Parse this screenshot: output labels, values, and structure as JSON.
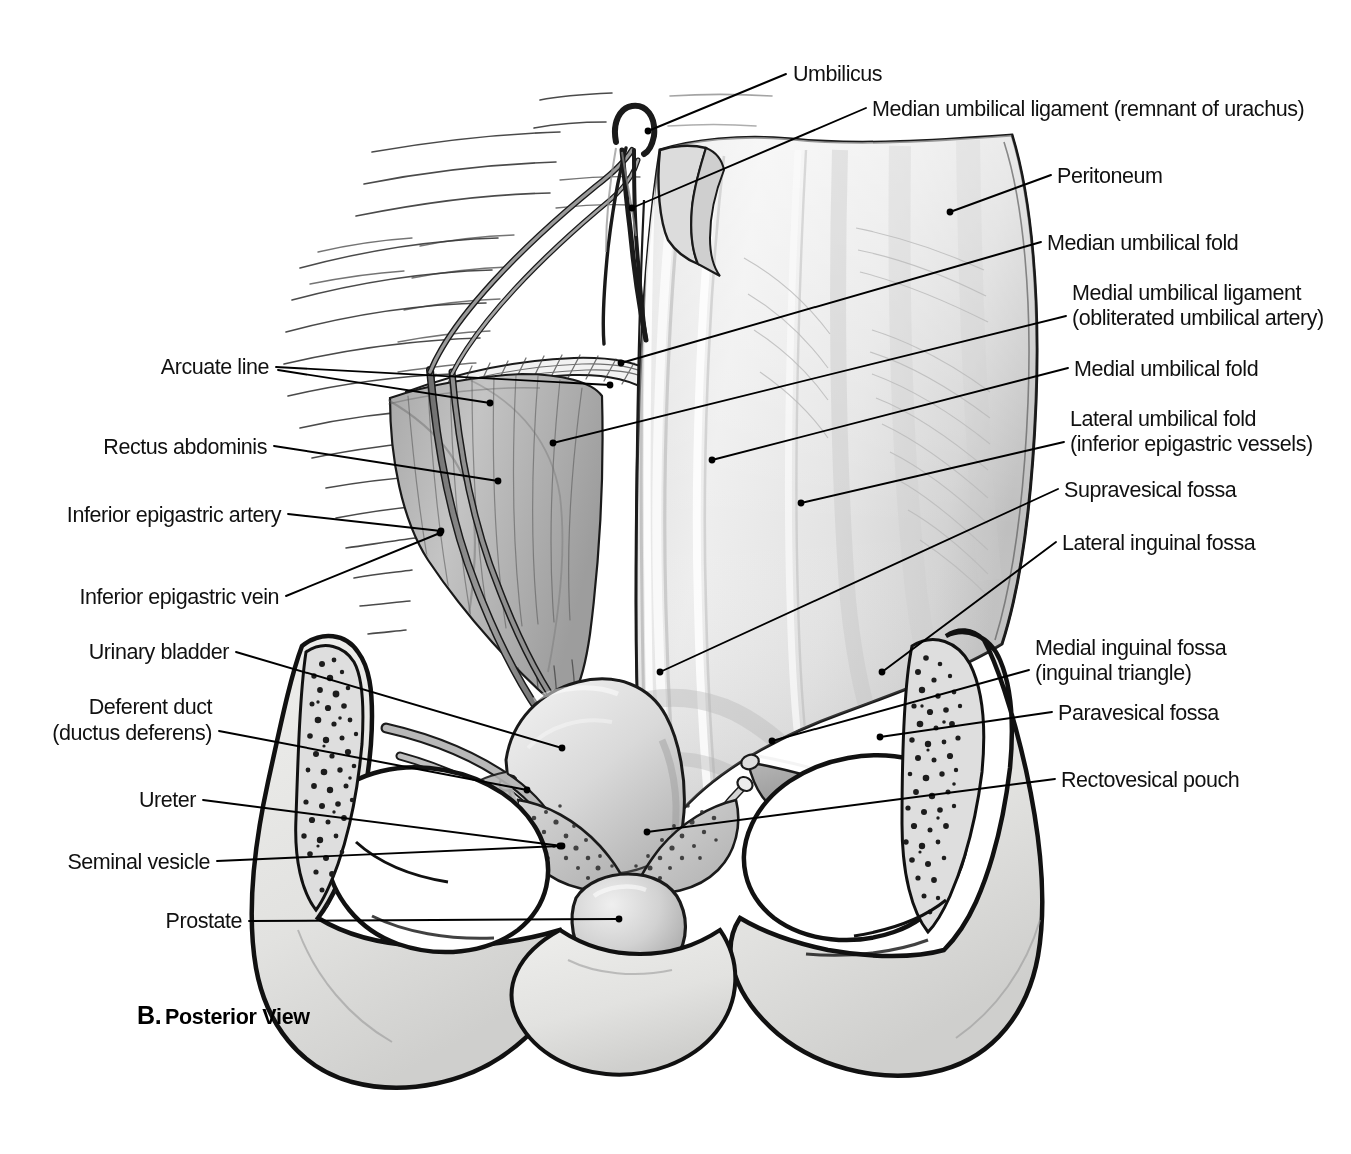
{
  "figure": {
    "caption_letter": "B.",
    "caption_text": "Posterior View"
  },
  "colors": {
    "ink": "#111111",
    "peritoneum_light": "#e9e9e9",
    "peritoneum_mid": "#d5d5d5",
    "peritoneum_shadow": "#b4b4b4",
    "bone_fill": "#e4e4e2",
    "bone_cut": "#d8d8d6",
    "muscle": "#bdbdbd",
    "vessel": "#8e8e8e",
    "bladder": "#d2d2d2",
    "prostate": "#c9c9c9",
    "background": "#ffffff"
  },
  "labels_right": [
    {
      "id": "umbilicus",
      "text": "Umbilicus",
      "x": 793,
      "y": 81,
      "leader": "M 786 74 L 648 131",
      "dot": [
        648,
        131
      ]
    },
    {
      "id": "median-umbilical-ligament",
      "text": "Median umbilical ligament (remnant of urachus)",
      "x": 872,
      "y": 116,
      "leader": "M 866 108 L 632 208",
      "dot": [
        632,
        208
      ]
    },
    {
      "id": "peritoneum",
      "text": "Peritoneum",
      "x": 1057,
      "y": 183,
      "leader": "M 1051 175 L 950 212",
      "dot": [
        950,
        212
      ]
    },
    {
      "id": "median-umbilical-fold",
      "text": "Median umbilical fold",
      "x": 1047,
      "y": 250,
      "leader": "M 1041 242 L 621 363",
      "dot": [
        621,
        363
      ]
    },
    {
      "id": "medial-umbilical-ligament",
      "text": "Medial umbilical ligament",
      "x": 1072,
      "y": 300,
      "leader": "M 1066 316 L 553 443",
      "dot": [
        553,
        443
      ]
    },
    {
      "id": "medial-umbilical-ligament-sub",
      "text": "(obliterated umbilical artery)",
      "x": 1072,
      "y": 325,
      "leader": "",
      "dot": null
    },
    {
      "id": "medial-umbilical-fold",
      "text": "Medial umbilical fold",
      "x": 1074,
      "y": 376,
      "leader": "M 1068 368 L 712 460",
      "dot": [
        712,
        460
      ]
    },
    {
      "id": "lateral-umbilical-fold",
      "text": "Lateral umbilical fold",
      "x": 1070,
      "y": 426,
      "leader": "M 1064 442 L 801 503",
      "dot": [
        801,
        503
      ]
    },
    {
      "id": "lateral-umbilical-fold-sub",
      "text": "(inferior epigastric vessels)",
      "x": 1070,
      "y": 451,
      "leader": "",
      "dot": null
    },
    {
      "id": "supravesical-fossa",
      "text": "Supravesical fossa",
      "x": 1064,
      "y": 497,
      "leader": "M 1058 489 L 660, 672",
      "dot": [
        660,
        672
      ]
    },
    {
      "id": "lateral-inguinal-fossa",
      "text": "Lateral inguinal fossa",
      "x": 1062,
      "y": 550,
      "leader": "M 1056 542 L 882 672",
      "dot": [
        882,
        672
      ]
    },
    {
      "id": "medial-inguinal-fossa",
      "text": "Medial inguinal fossa",
      "x": 1035,
      "y": 655,
      "leader": "M 1029 670 L 772 741",
      "dot": [
        772,
        741
      ]
    },
    {
      "id": "medial-inguinal-fossa-sub",
      "text": "(inguinal triangle)",
      "x": 1035,
      "y": 680,
      "leader": "",
      "dot": null
    },
    {
      "id": "paravesical-fossa",
      "text": "Paravesical fossa",
      "x": 1058,
      "y": 720,
      "leader": "M 1052 712 L 880 737",
      "dot": [
        880,
        737
      ]
    },
    {
      "id": "rectovesical-pouch",
      "text": "Rectovesical pouch",
      "x": 1061,
      "y": 787,
      "leader": "M 1055 779 L 647 832",
      "dot": [
        647,
        832
      ]
    }
  ],
  "labels_left": [
    {
      "id": "arcuate-line",
      "text": "Arcuate line",
      "x": 269,
      "y": 374,
      "leader": "M 276 367 L 610 385",
      "leader2": "M 276 369 L 490 403",
      "dot": [
        610,
        385
      ],
      "dot2": [
        490,
        403
      ]
    },
    {
      "id": "rectus-abdominis",
      "text": "Rectus abdominis",
      "x": 267,
      "y": 454,
      "leader": "M 274 446 L 498 481",
      "dot": [
        498,
        481
      ]
    },
    {
      "id": "inferior-epigastric-artery",
      "text": "Inferior epigastric artery",
      "x": 281,
      "y": 522,
      "leader": "M 288 514 L 441 531",
      "dot": [
        441,
        531
      ]
    },
    {
      "id": "inferior-epigastric-vein",
      "text": "Inferior epigastric vein",
      "x": 279,
      "y": 604,
      "leader": "M 286 596 L 440 533",
      "dot": [
        440,
        533
      ]
    },
    {
      "id": "urinary-bladder",
      "text": "Urinary bladder",
      "x": 229,
      "y": 659,
      "leader": "M 236 652 L 562 748",
      "dot": [
        562,
        748
      ]
    },
    {
      "id": "deferent-duct",
      "text": "Deferent duct",
      "x": 212,
      "y": 714,
      "leader": "M 219 731 L 527 790",
      "dot": [
        527,
        790
      ]
    },
    {
      "id": "deferent-duct-sub",
      "text": "(ductus deferens)",
      "x": 212,
      "y": 740,
      "leader": "",
      "dot": null
    },
    {
      "id": "ureter",
      "text": "Ureter",
      "x": 196,
      "y": 807,
      "leader": "M 203 800 L 562 846",
      "dot": [
        562,
        846
      ]
    },
    {
      "id": "seminal-vesicle",
      "text": "Seminal vesicle",
      "x": 210,
      "y": 869,
      "leader": "M 217 861 L 560 846",
      "dot": [
        560,
        846
      ]
    },
    {
      "id": "prostate",
      "text": "Prostate",
      "x": 242,
      "y": 928,
      "leader": "M 249 921 L 619 919",
      "dot": [
        619,
        919
      ]
    }
  ]
}
